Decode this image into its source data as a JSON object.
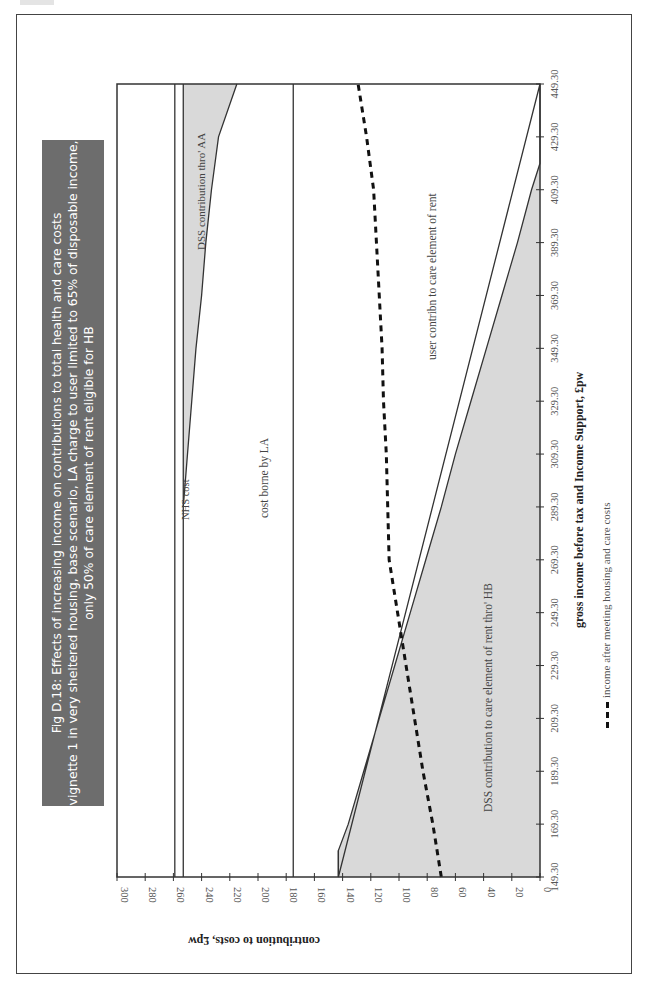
{
  "title": {
    "line1": "Fig D.18:  Effects of increasing income on contributions to total health and care costs",
    "line2": "vignette 1 in very sheltered housing, base scenario, LA charge to user limited to 65% of disposable income,",
    "line3": "only 50% of care element of rent eligible for HB"
  },
  "labels": {
    "nhs": "NHS cost",
    "aa": "DSS contribution thro' AA",
    "la": "cost borne by LA",
    "user": "user contribn to care element of rent",
    "hb": "DSS contribution to care element of rent thro' HB",
    "legend": "income after meeting housing and care costs"
  },
  "colors": {
    "shade": "#d9d9d9",
    "line": "#333333",
    "dash": "#111111",
    "title_bg": "#6d6d6d"
  },
  "chart_data": {
    "type": "area",
    "orientation": "rotated 90 degrees counter-clockwise (income axis vertical, increasing upward; cost axis horizontal, increasing leftward)",
    "xlabel": "gross income before tax and Income Support, £pw",
    "ylabel": "contribution to costs, £pw",
    "x_ticks": [
      "149.30",
      "169.30",
      "189.30",
      "209.30",
      "229.30",
      "249.30",
      "269.30",
      "289.30",
      "309.30",
      "329.30",
      "349.30",
      "369.30",
      "389.30",
      "409.30",
      "429.30",
      "449.30"
    ],
    "y_ticks": [
      0,
      20,
      40,
      60,
      80,
      100,
      120,
      140,
      160,
      180,
      200,
      220,
      240,
      260,
      280,
      300
    ],
    "xlim": [
      149.3,
      449.3
    ],
    "ylim": [
      0,
      300
    ],
    "grid": false,
    "legend_position": "bottom",
    "series": [
      {
        "name": "DSS contribution to care element of rent thro' HB",
        "kind": "shaded area (0 to boundary)",
        "x": [
          149.3,
          159.3,
          169.3,
          189.3,
          209.3,
          229.3,
          249.3,
          269.3,
          289.3,
          309.3,
          329.3,
          349.3,
          369.3,
          389.3,
          409.3,
          419.3,
          449.3
        ],
        "values": [
          143,
          143,
          136,
          125,
          114,
          103,
          92,
          81,
          70,
          60,
          49,
          38,
          27,
          16,
          6,
          0,
          0
        ]
      },
      {
        "name": "user contribn to care element of rent",
        "kind": "region between HB boundary and LA line",
        "value": 175
      },
      {
        "name": "cost borne by LA",
        "kind": "line",
        "value": 175
      },
      {
        "name": "DSS contribution thro' AA",
        "kind": "shaded area (boundary to 253)",
        "x": [
          289.3,
          309.3,
          329.3,
          349.3,
          369.3,
          389.3,
          409.3,
          429.3,
          449.3
        ],
        "values": [
          253,
          250,
          247,
          244,
          240,
          237,
          233,
          228,
          215
        ]
      },
      {
        "name": "AA base level",
        "kind": "line",
        "value": 253
      },
      {
        "name": "NHS cost",
        "kind": "line",
        "value": 259
      },
      {
        "name": "income after meeting housing and care costs",
        "kind": "dashed line",
        "x": [
          149.3,
          169.3,
          189.3,
          209.3,
          229.3,
          249.3,
          269.3,
          289.3,
          309.3,
          329.3,
          349.3,
          369.3,
          389.3,
          409.3,
          429.3,
          449.3
        ],
        "values": [
          70,
          76,
          83,
          89,
          95,
          101,
          107,
          108,
          109,
          111,
          112,
          114,
          116,
          118,
          123,
          129
        ]
      }
    ]
  }
}
